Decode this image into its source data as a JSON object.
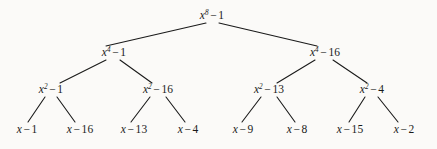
{
  "figure": {
    "type": "binary-tree-diagram",
    "title": "",
    "background_color": "#fbfaf8",
    "text_color": "#1a1a1a",
    "edge_color": "#1a1a1a"
  },
  "tree": {
    "levels": 4,
    "nodes": [
      {
        "id": "root",
        "label": "x⁸ − 1",
        "base": "x",
        "exponent": "8",
        "operator": "−",
        "constant": "1",
        "x": 212,
        "y": 16,
        "level": 0
      },
      {
        "id": "n10",
        "label": "x⁴ − 1",
        "base": "x",
        "exponent": "4",
        "operator": "−",
        "constant": "1",
        "x": 114,
        "y": 53,
        "level": 1
      },
      {
        "id": "n11",
        "label": "x⁴ − 16",
        "base": "x",
        "exponent": "4",
        "operator": "−",
        "constant": "16",
        "x": 325,
        "y": 53,
        "level": 1
      },
      {
        "id": "n20",
        "label": "x² − 1",
        "base": "x",
        "exponent": "2",
        "operator": "−",
        "constant": "1",
        "x": 51,
        "y": 90,
        "level": 2
      },
      {
        "id": "n21",
        "label": "x² − 16",
        "base": "x",
        "exponent": "2",
        "operator": "−",
        "constant": "16",
        "x": 158,
        "y": 90,
        "level": 2
      },
      {
        "id": "n22",
        "label": "x² − 13",
        "base": "x",
        "exponent": "2",
        "operator": "−",
        "constant": "13",
        "x": 269,
        "y": 90,
        "level": 2
      },
      {
        "id": "n23",
        "label": "x² − 4",
        "base": "x",
        "exponent": "2",
        "operator": "−",
        "constant": "4",
        "x": 372,
        "y": 90,
        "level": 2
      },
      {
        "id": "l0",
        "label": "x − 1",
        "base": "x",
        "exponent": "",
        "operator": "−",
        "constant": "1",
        "x": 27,
        "y": 130,
        "level": 3
      },
      {
        "id": "l1",
        "label": "x − 16",
        "base": "x",
        "exponent": "",
        "operator": "−",
        "constant": "16",
        "x": 80,
        "y": 130,
        "level": 3
      },
      {
        "id": "l2",
        "label": "x − 13",
        "base": "x",
        "exponent": "",
        "operator": "−",
        "constant": "13",
        "x": 134,
        "y": 130,
        "level": 3
      },
      {
        "id": "l3",
        "label": "x − 4",
        "base": "x",
        "exponent": "",
        "operator": "−",
        "constant": "4",
        "x": 188,
        "y": 130,
        "level": 3
      },
      {
        "id": "l4",
        "label": "x − 9",
        "base": "x",
        "exponent": "",
        "operator": "−",
        "constant": "9",
        "x": 243,
        "y": 130,
        "level": 3
      },
      {
        "id": "l5",
        "label": "x − 8",
        "base": "x",
        "exponent": "",
        "operator": "−",
        "constant": "8",
        "x": 297,
        "y": 130,
        "level": 3
      },
      {
        "id": "l6",
        "label": "x − 15",
        "base": "x",
        "exponent": "",
        "operator": "−",
        "constant": "15",
        "x": 350,
        "y": 130,
        "level": 3
      },
      {
        "id": "l7",
        "label": "x − 2",
        "base": "x",
        "exponent": "",
        "operator": "−",
        "constant": "2",
        "x": 404,
        "y": 130,
        "level": 3
      }
    ],
    "edges": [
      {
        "from": "root",
        "to": "n10",
        "x1": 206,
        "y1": 23,
        "x2": 106,
        "y2": 46
      },
      {
        "from": "root",
        "to": "n11",
        "x1": 219,
        "y1": 23,
        "x2": 317,
        "y2": 46
      },
      {
        "from": "n10",
        "to": "n20",
        "x1": 106,
        "y1": 60,
        "x2": 60,
        "y2": 83
      },
      {
        "from": "n10",
        "to": "n21",
        "x1": 120,
        "y1": 60,
        "x2": 152,
        "y2": 83
      },
      {
        "from": "n11",
        "to": "n22",
        "x1": 315,
        "y1": 60,
        "x2": 277,
        "y2": 83
      },
      {
        "from": "n11",
        "to": "n23",
        "x1": 333,
        "y1": 60,
        "x2": 367,
        "y2": 83
      },
      {
        "from": "n20",
        "to": "l0",
        "x1": 45,
        "y1": 97,
        "x2": 28,
        "y2": 122
      },
      {
        "from": "n20",
        "to": "l1",
        "x1": 57,
        "y1": 97,
        "x2": 75,
        "y2": 122
      },
      {
        "from": "n21",
        "to": "l2",
        "x1": 150,
        "y1": 97,
        "x2": 131,
        "y2": 122
      },
      {
        "from": "n21",
        "to": "l3",
        "x1": 166,
        "y1": 97,
        "x2": 185,
        "y2": 122
      },
      {
        "from": "n22",
        "to": "l4",
        "x1": 261,
        "y1": 97,
        "x2": 242,
        "y2": 122
      },
      {
        "from": "n22",
        "to": "l5",
        "x1": 277,
        "y1": 97,
        "x2": 295,
        "y2": 122
      },
      {
        "from": "n23",
        "to": "l6",
        "x1": 365,
        "y1": 97,
        "x2": 349,
        "y2": 122
      },
      {
        "from": "n23",
        "to": "l7",
        "x1": 378,
        "y1": 97,
        "x2": 398,
        "y2": 122
      }
    ]
  }
}
